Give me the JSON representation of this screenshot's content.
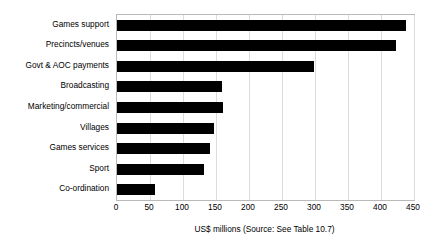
{
  "chart_data": {
    "type": "bar",
    "orientation": "horizontal",
    "title": "",
    "xlabel": "US$ millions (Source: See Table 10.7)",
    "ylabel": "",
    "xlim": [
      0,
      450
    ],
    "ticks": [
      "0",
      "50",
      "100",
      "150",
      "200",
      "250",
      "300",
      "350",
      "400",
      "450"
    ],
    "tick_values": [
      0,
      50,
      100,
      150,
      200,
      250,
      300,
      350,
      400,
      450
    ],
    "grid": true,
    "legend": "none",
    "bar_color": "#000000",
    "categories": [
      "Games support",
      "Precincts/venues",
      "Govt & AOC payments",
      "Broadcasting",
      "Marketing/commercial",
      "Villages",
      "Games services",
      "Sport",
      "Co-ordination"
    ],
    "values": [
      438,
      423,
      298,
      159,
      160,
      147,
      141,
      132,
      57
    ]
  },
  "axis": {
    "caption": "US$ millions (Source: See Table 10.7)"
  }
}
